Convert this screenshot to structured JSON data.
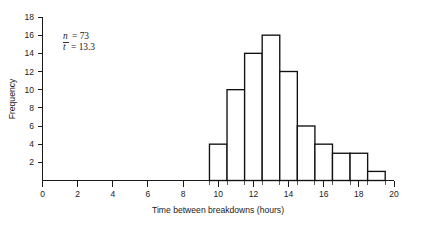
{
  "chart_data": {
    "type": "bar",
    "title": "",
    "subtitle": "",
    "xlabel": "Time between breakdowns (hours)",
    "ylabel": "Frequency",
    "xlim": [
      0,
      20
    ],
    "ylim": [
      0,
      18
    ],
    "grid": false,
    "legend": null,
    "bin_width": 1,
    "bin_edges": [
      9.5,
      10.5,
      11.5,
      12.5,
      13.5,
      14.5,
      15.5,
      16.5,
      17.5,
      18.5,
      19.5
    ],
    "categories": [
      "9.5-10.5",
      "10.5-11.5",
      "11.5-12.5",
      "12.5-13.5",
      "13.5-14.5",
      "14.5-15.5",
      "15.5-16.5",
      "16.5-17.5",
      "17.5-18.5",
      "18.5-19.5"
    ],
    "bin_centers": [
      10,
      11,
      12,
      13,
      14,
      15,
      16,
      17,
      18,
      19
    ],
    "values": [
      4,
      10,
      14,
      16,
      12,
      6,
      4,
      3,
      3,
      1
    ],
    "x_ticks": [
      0,
      2,
      4,
      6,
      8,
      10,
      12,
      14,
      16,
      18,
      20
    ],
    "x_tick_labels": [
      "0",
      "2",
      "4",
      "6",
      "8",
      "10",
      "12",
      "14",
      "16",
      "18",
      "20"
    ],
    "y_ticks": [
      2,
      4,
      6,
      8,
      10,
      12,
      14,
      16,
      18
    ],
    "y_tick_labels": [
      "2",
      "4",
      "6",
      "8",
      "10",
      "12",
      "14",
      "16",
      "18"
    ],
    "annotations": [
      {
        "symbol": "n",
        "overbar": false,
        "equals": "= 73",
        "value": 73
      },
      {
        "symbol": "t",
        "overbar": true,
        "equals": "= 13.3",
        "value": 13.3
      }
    ],
    "bar_fill": "#ffffff",
    "bar_stroke": "#111111",
    "axis_color": "#1a1a1a",
    "background": "#ffffff"
  },
  "axes": {
    "y_label": "Frequency",
    "x_label": "Time between breakdowns (hours)"
  },
  "annotation_lines": {
    "line1_symbol": "n",
    "line1_rest": "= 73",
    "line2_symbol": "t",
    "line2_rest": "= 13.3"
  }
}
